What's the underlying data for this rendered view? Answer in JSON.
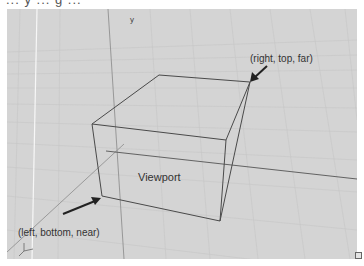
{
  "header": {
    "cropped_text": "... y ... g ..."
  },
  "viewport": {
    "background": "#d4d4d4",
    "label": "Viewport"
  },
  "annotations": {
    "far_corner": "(right, top, far)",
    "near_corner": "(left, bottom, near)"
  },
  "axes": {
    "x": "x",
    "y": "y",
    "z": "z"
  },
  "box": {
    "front_face": {
      "tl": [
        92,
        124
      ],
      "tr": [
        226,
        140
      ],
      "br": [
        220,
        221
      ],
      "bl": [
        102,
        196
      ]
    },
    "back_top": {
      "tl": [
        159,
        75
      ],
      "tr": [
        250,
        82
      ]
    },
    "back_bottom_right": [
      246,
      196
    ],
    "edge_color": "#4a4a4a"
  },
  "arrows": {
    "far": {
      "from": [
        267,
        66
      ],
      "to": [
        251,
        81
      ]
    },
    "near": {
      "from": [
        63,
        214
      ],
      "to": [
        100,
        199
      ]
    }
  },
  "colors": {
    "grid_line": "#c2c2c2",
    "axis_line": "#7a7a7a",
    "white_axis": "#f4f4f4",
    "text": "#333333"
  }
}
